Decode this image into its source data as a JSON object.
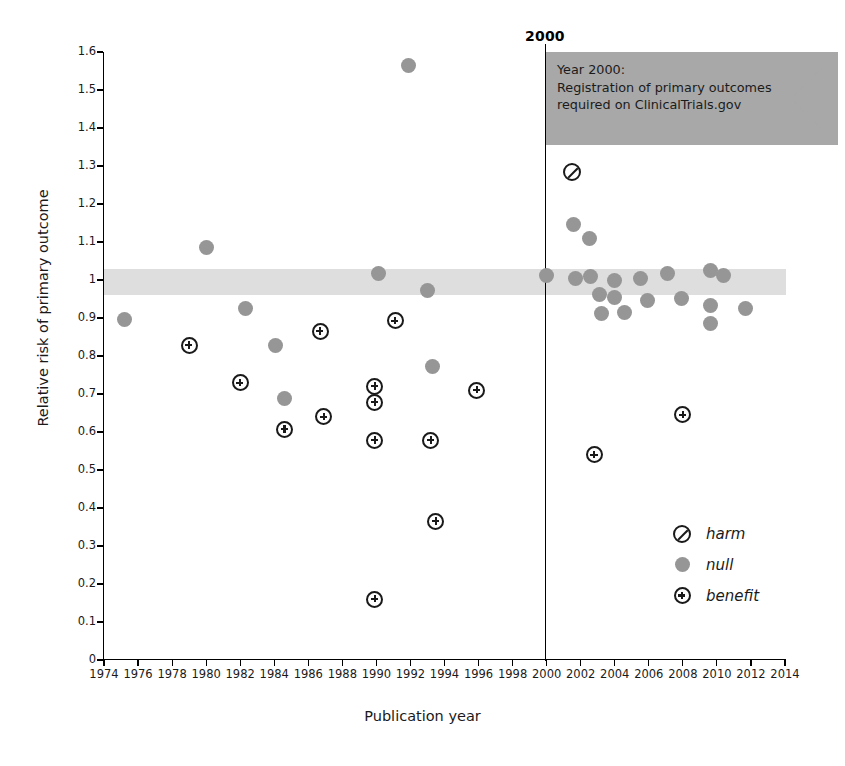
{
  "chart_data": {
    "type": "scatter",
    "title": "",
    "xlabel": "Publication year",
    "ylabel": "Relative risk of primary outcome",
    "xlim": [
      1974,
      2014
    ],
    "ylim": [
      0,
      1.6
    ],
    "xticks": [
      1974,
      1976,
      1978,
      1980,
      1982,
      1984,
      1986,
      1988,
      1990,
      1992,
      1994,
      1996,
      1998,
      2000,
      2002,
      2004,
      2006,
      2008,
      2010,
      2012,
      2014
    ],
    "yticks": [
      "0",
      "0.1",
      "0.2",
      "0.3",
      "0.4",
      "0.5",
      "0.6",
      "0.7",
      "0.8",
      "0.9",
      "1",
      "1.1",
      "1.2",
      "1.3",
      "1.4",
      "1.5",
      "1.6"
    ],
    "grid": false,
    "legend_position": "inside-bottom-right",
    "null_band": {
      "label": "null region",
      "ymin": 0.96,
      "ymax": 1.03,
      "color": "#dedede"
    },
    "reference_line": {
      "x": 2000,
      "label": "2000",
      "color": "#000000"
    },
    "annotation": {
      "shape": "flag",
      "color": "#a8a8a8",
      "lines": [
        "Year 2000:",
        "Registration of primary outcomes",
        "required on ClinicalTrials.gov"
      ]
    },
    "legend": [
      {
        "key": "harm",
        "label": "harm",
        "marker": "circle-slash",
        "color": "#1a1a1a"
      },
      {
        "key": "null",
        "label": "null",
        "marker": "filled-circle",
        "color": "#969696"
      },
      {
        "key": "benefit",
        "label": "benefit",
        "marker": "circle-plus",
        "color": "#1a1a1a"
      }
    ],
    "series": [
      {
        "name": "harm",
        "marker": "circle-slash",
        "points": [
          {
            "x": 2001.5,
            "y": 1.285
          }
        ]
      },
      {
        "name": "null",
        "marker": "filled-circle",
        "color": "#969696",
        "points": [
          {
            "x": 1975.2,
            "y": 0.895
          },
          {
            "x": 1980.0,
            "y": 1.085
          },
          {
            "x": 1982.3,
            "y": 0.925
          },
          {
            "x": 1984.1,
            "y": 0.828
          },
          {
            "x": 1984.6,
            "y": 0.687
          },
          {
            "x": 1990.1,
            "y": 1.018
          },
          {
            "x": 1991.9,
            "y": 1.565
          },
          {
            "x": 1993.0,
            "y": 0.972
          },
          {
            "x": 1993.3,
            "y": 0.772
          },
          {
            "x": 2000.0,
            "y": 1.012
          },
          {
            "x": 2001.6,
            "y": 1.145
          },
          {
            "x": 2002.5,
            "y": 1.108
          },
          {
            "x": 2001.7,
            "y": 1.005
          },
          {
            "x": 2002.6,
            "y": 1.008
          },
          {
            "x": 2003.1,
            "y": 0.963
          },
          {
            "x": 2003.2,
            "y": 0.912
          },
          {
            "x": 2004.0,
            "y": 1.0
          },
          {
            "x": 2004.0,
            "y": 0.955
          },
          {
            "x": 2004.6,
            "y": 0.915
          },
          {
            "x": 2005.5,
            "y": 1.003
          },
          {
            "x": 2005.9,
            "y": 0.945
          },
          {
            "x": 2007.1,
            "y": 1.018
          },
          {
            "x": 2007.9,
            "y": 0.952
          },
          {
            "x": 2009.6,
            "y": 1.025
          },
          {
            "x": 2009.6,
            "y": 0.932
          },
          {
            "x": 2009.6,
            "y": 0.885
          },
          {
            "x": 2010.4,
            "y": 1.012
          },
          {
            "x": 2011.7,
            "y": 0.925
          }
        ]
      },
      {
        "name": "benefit",
        "marker": "circle-plus",
        "color": "#1a1a1a",
        "points": [
          {
            "x": 1979.0,
            "y": 0.828
          },
          {
            "x": 1982.0,
            "y": 0.73
          },
          {
            "x": 1984.6,
            "y": 0.607
          },
          {
            "x": 1986.7,
            "y": 0.865
          },
          {
            "x": 1986.9,
            "y": 0.64
          },
          {
            "x": 1989.9,
            "y": 0.72
          },
          {
            "x": 1989.9,
            "y": 0.678
          },
          {
            "x": 1989.9,
            "y": 0.578
          },
          {
            "x": 1989.9,
            "y": 0.16
          },
          {
            "x": 1991.1,
            "y": 0.893
          },
          {
            "x": 1993.2,
            "y": 0.578
          },
          {
            "x": 1993.5,
            "y": 0.365
          },
          {
            "x": 1995.9,
            "y": 0.71
          },
          {
            "x": 2002.8,
            "y": 0.54
          },
          {
            "x": 2008.0,
            "y": 0.645
          }
        ]
      }
    ]
  }
}
